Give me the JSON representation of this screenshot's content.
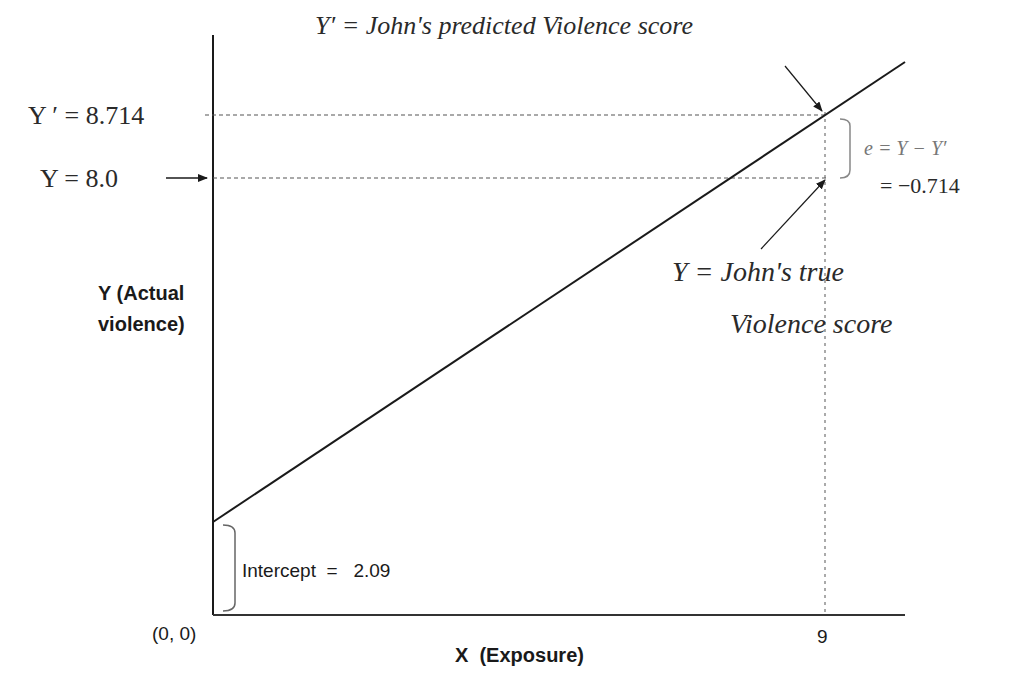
{
  "diagram": {
    "axes": {
      "y_label_line1": "Y (Actual",
      "y_label_line2": "violence)",
      "x_label": "X  (Exposure)",
      "origin_label": "(0, 0)",
      "x_tick_label": "9"
    },
    "annotations": {
      "y_prime_value_label": "Y ′ = 8.714",
      "y_value_label": "Y   = 8.0",
      "y_prime_description": "Y′ = John's predicted Violence score",
      "y_description_line1": "Y = John's true",
      "y_description_line2": "Violence score",
      "error_formula": "e = Y − Y′",
      "error_value": "= −0.714",
      "intercept_label": "Intercept  =   2.09"
    },
    "values": {
      "intercept": 2.09,
      "x": 9,
      "y_predicted": 8.714,
      "y_actual": 8.0,
      "error": -0.714
    },
    "colors": {
      "line": "#1a1a1a",
      "dashed": "#555555",
      "dotted": "#aaaaaa",
      "bracket": "#777777",
      "text": "#2a2a2a"
    }
  }
}
